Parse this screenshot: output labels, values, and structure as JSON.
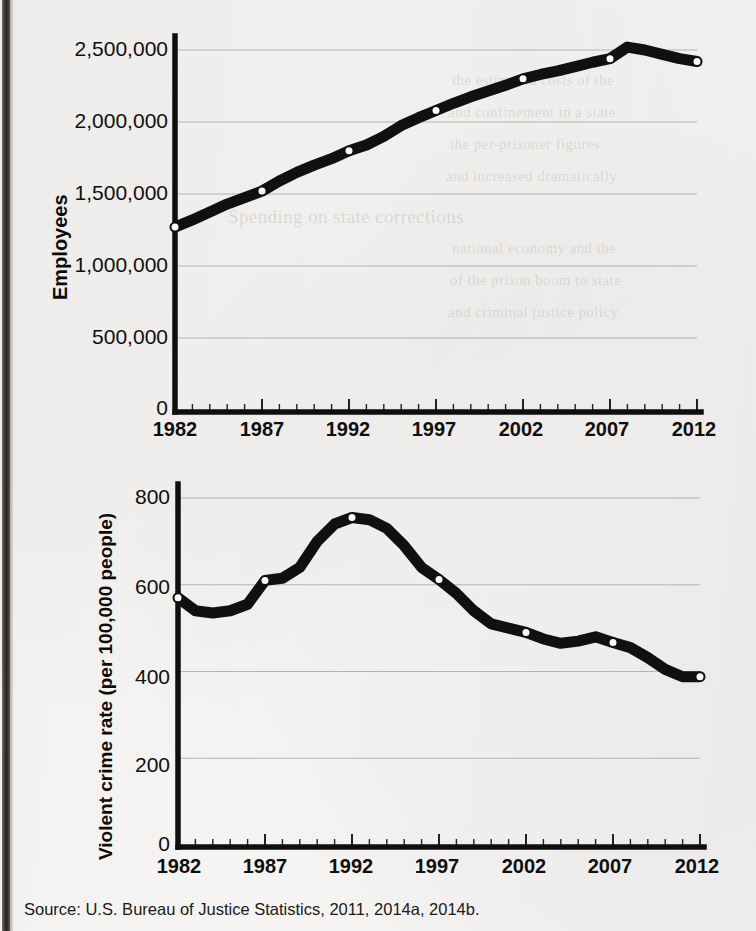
{
  "figure": {
    "source_note": "Source: U.S. Bureau of Justice Statistics, 2011, 2014a, 2014b."
  },
  "chart_data": [
    {
      "type": "line",
      "id": "employees-chart",
      "title": "",
      "xlabel": "",
      "ylabel": "Employees",
      "xlim": [
        1982,
        2012
      ],
      "ylim": [
        0,
        2700000
      ],
      "grid": true,
      "legend": "none",
      "ytick_labels": [
        "2,500,000",
        "2,000,000",
        "1,500,000",
        "1,000,000",
        "500,000",
        "0"
      ],
      "ytick_values": [
        2500000,
        2000000,
        1500000,
        1000000,
        500000,
        0
      ],
      "xtick_labels": [
        "1982",
        "1987",
        "1992",
        "1997",
        "2002",
        "2007",
        "2012"
      ],
      "xtick_values": [
        1982,
        1987,
        1992,
        1997,
        2002,
        2007,
        2012
      ],
      "marker_years": [
        1982,
        1987,
        1992,
        1997,
        2002,
        2007,
        2012
      ],
      "x": [
        1982,
        1983,
        1984,
        1985,
        1986,
        1987,
        1988,
        1989,
        1990,
        1991,
        1992,
        1993,
        1994,
        1995,
        1996,
        1997,
        1998,
        1999,
        2000,
        2001,
        2002,
        2003,
        2004,
        2005,
        2006,
        2007,
        2008,
        2009,
        2010,
        2011,
        2012
      ],
      "values": [
        1270000,
        1320000,
        1375000,
        1430000,
        1475000,
        1520000,
        1590000,
        1650000,
        1700000,
        1745000,
        1800000,
        1840000,
        1900000,
        1975000,
        2030000,
        2080000,
        2130000,
        2175000,
        2215000,
        2255000,
        2300000,
        2330000,
        2355000,
        2385000,
        2415000,
        2440000,
        2520000,
        2500000,
        2470000,
        2440000,
        2420000
      ]
    },
    {
      "type": "line",
      "id": "violent-crime-chart",
      "title": "",
      "xlabel": "",
      "ylabel": "Violent crime rate (per 100,000 people)",
      "xlim": [
        1982,
        2012
      ],
      "ylim": [
        0,
        870
      ],
      "grid": true,
      "legend": "none",
      "ytick_labels": [
        "800",
        "600",
        "400",
        "200",
        "0"
      ],
      "ytick_values": [
        800,
        600,
        400,
        200,
        0
      ],
      "xtick_labels": [
        "1982",
        "1987",
        "1992",
        "1997",
        "2002",
        "2007",
        "2012"
      ],
      "xtick_values": [
        1982,
        1987,
        1992,
        1997,
        2002,
        2007,
        2012
      ],
      "marker_years": [
        1982,
        1987,
        1992,
        1997,
        2002,
        2007,
        2012
      ],
      "x": [
        1982,
        1983,
        1984,
        1985,
        1986,
        1987,
        1988,
        1989,
        1990,
        1991,
        1992,
        1993,
        1994,
        1995,
        1996,
        1997,
        1998,
        1999,
        2000,
        2001,
        2002,
        2003,
        2004,
        2005,
        2006,
        2007,
        2008,
        2009,
        2010,
        2011,
        2012
      ],
      "values": [
        570,
        540,
        535,
        540,
        555,
        610,
        615,
        640,
        700,
        740,
        755,
        750,
        730,
        690,
        640,
        612,
        580,
        540,
        510,
        500,
        490,
        475,
        465,
        470,
        480,
        467,
        455,
        432,
        405,
        388,
        388
      ]
    }
  ],
  "ghost_text": {
    "lines": [
      "the estimated costs of the",
      "and confinement in a state",
      "the per-prisoner figures",
      "and increased dramatically",
      "Spending on state corrections",
      "national economy and the",
      "of the prison boom to state",
      "and criminal justice policy"
    ]
  }
}
